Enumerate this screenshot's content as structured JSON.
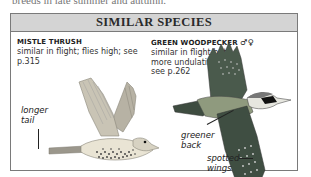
{
  "page": {
    "cutoff_text": "breeds in late summer and autumn."
  },
  "box": {
    "title": "SIMILAR SPECIES",
    "species": [
      {
        "name": "MISTLE THRUSH",
        "sex_symbols": "",
        "description": "similar in flight; flies high; see p.315",
        "annotations": [
          {
            "text": "longer tail"
          }
        ]
      },
      {
        "name": "GREEN WOODPECKER",
        "sex_symbols": "♂♀",
        "description": "similar in flight but more undulating; see p.262",
        "annotations": [
          {
            "text": "greener back"
          },
          {
            "text": "spotted wings"
          }
        ]
      }
    ]
  },
  "colors": {
    "header_bg": "#d4d4d4",
    "border": "#7a7a7a"
  }
}
